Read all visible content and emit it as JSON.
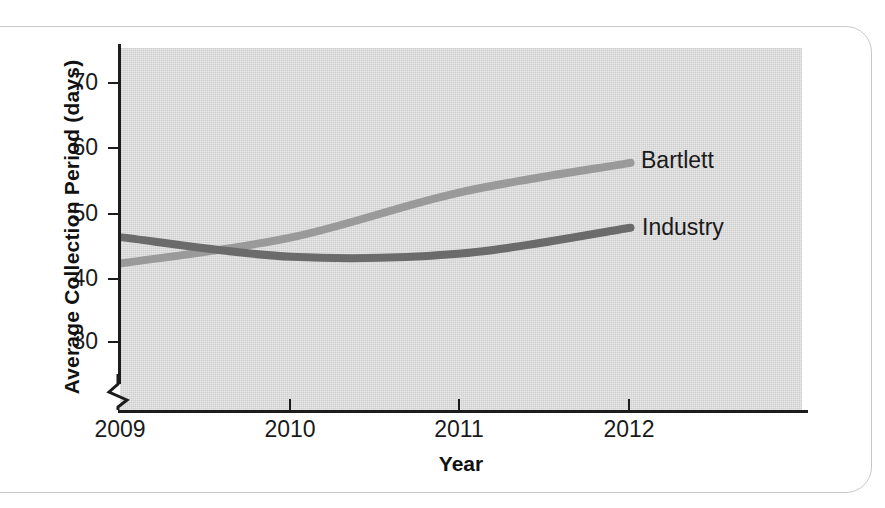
{
  "chart_data": {
    "type": "line",
    "title": "",
    "xlabel": "Year",
    "ylabel": "Average Collection Period (days)",
    "categories": [
      "2009",
      "2010",
      "2011",
      "2012"
    ],
    "x_tick_labels": [
      "2009",
      "2010",
      "2011",
      "2012"
    ],
    "y_tick_labels": [
      "30",
      "40",
      "50",
      "60",
      "70"
    ],
    "y_tick_values": [
      30,
      40,
      50,
      60,
      70
    ],
    "ylim": [
      26,
      74
    ],
    "xlim": [
      "2009",
      "2012"
    ],
    "y_axis_break": true,
    "y_axis_break_label": "axis-break-zigzag",
    "grid": false,
    "legend_position": "right-inline-labels",
    "plot_background": "#d8d8d8",
    "series": [
      {
        "name": "Bartlett",
        "color": "#9a9a9a",
        "values": [
          42,
          46,
          53,
          57.5
        ]
      },
      {
        "name": "Industry",
        "color": "#6b6b6b",
        "values": [
          46,
          43,
          43.5,
          47.5
        ]
      }
    ]
  },
  "axis": {
    "x_title": "Year",
    "y_title": "Average Collection Period (days)"
  },
  "labels": {
    "bartlett": "Bartlett",
    "industry": "Industry"
  }
}
